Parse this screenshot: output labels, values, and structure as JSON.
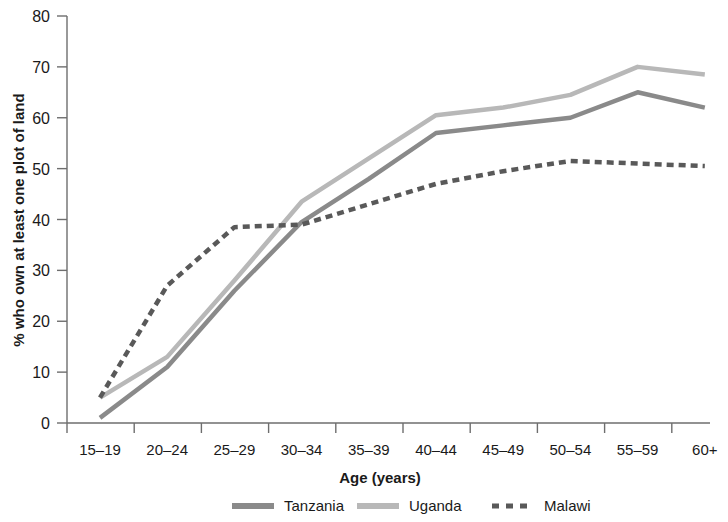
{
  "chart_data": {
    "type": "line",
    "title": "",
    "xlabel": "Age (years)",
    "ylabel": "% who own at least one plot of land",
    "categories": [
      "15–19",
      "20–24",
      "25–29",
      "30–34",
      "35–39",
      "40–44",
      "45–49",
      "50–54",
      "55–59",
      "60+"
    ],
    "ylim": [
      0,
      80
    ],
    "yticks": [
      0,
      10,
      20,
      30,
      40,
      50,
      60,
      70,
      80
    ],
    "ytick_labels": [
      "0",
      "10",
      "20",
      "30",
      "40",
      "50",
      "60",
      "70",
      "80"
    ],
    "grid": false,
    "legend_position": "bottom",
    "series": [
      {
        "name": "Tanzania",
        "values": [
          1,
          11,
          26,
          39.5,
          48,
          57,
          58.5,
          60,
          65,
          62
        ],
        "color": "#8a8a8a",
        "style": "solid",
        "width": 4.5
      },
      {
        "name": "Uganda",
        "values": [
          5,
          13,
          28,
          43.5,
          52,
          60.5,
          62,
          64.5,
          70,
          68.5
        ],
        "color": "#b8b8b8",
        "style": "solid",
        "width": 4.5
      },
      {
        "name": "Malawi",
        "values": [
          5,
          27,
          38.5,
          39,
          43,
          47,
          49.5,
          51.5,
          51,
          50.5
        ],
        "color": "#595959",
        "style": "dashed",
        "width": 4.5
      }
    ]
  },
  "axis": {
    "ylabel": "% who own at least one plot of land",
    "xlabel": "Age (years)"
  },
  "legend": {
    "items": [
      {
        "label": "Tanzania"
      },
      {
        "label": "Uganda"
      },
      {
        "label": "Malawi"
      }
    ]
  }
}
